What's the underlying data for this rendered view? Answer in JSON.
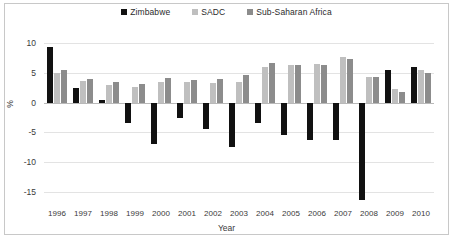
{
  "chart_data": {
    "type": "bar",
    "title": "",
    "subtitle": "",
    "xlabel": "Year",
    "ylabel": "%",
    "ylim": [
      -17.5,
      11
    ],
    "yticks": [
      10,
      5,
      0,
      -5,
      -10,
      -15
    ],
    "ytick_labels": [
      "10",
      "5",
      "0",
      "-5",
      "-10",
      "-15"
    ],
    "grid": true,
    "legend_position": "top-center",
    "categories": [
      "1996",
      "1997",
      "1998",
      "1999",
      "2000",
      "2001",
      "2002",
      "2003",
      "2004",
      "2005",
      "2006",
      "2007",
      "2008",
      "2009",
      "2010"
    ],
    "series": [
      {
        "name": "Zimbabwe",
        "color": "#111111",
        "values": [
          9.4,
          2.5,
          0.5,
          -3.5,
          -7.0,
          -2.5,
          -4.5,
          -7.5,
          -3.5,
          -5.5,
          -6.3,
          -6.2,
          -16.3,
          5.4,
          6.0
        ]
      },
      {
        "name": "SADC",
        "color": "#bfbfbf",
        "values": [
          4.9,
          3.6,
          2.9,
          2.7,
          3.4,
          3.5,
          3.3,
          3.5,
          6.0,
          6.3,
          6.5,
          7.6,
          4.3,
          2.2,
          5.5
        ]
      },
      {
        "name": "Sub-Saharan Africa",
        "color": "#8c8c8c",
        "values": [
          5.5,
          4.0,
          3.5,
          3.2,
          4.1,
          3.8,
          3.9,
          4.7,
          6.7,
          6.3,
          6.3,
          7.3,
          4.3,
          1.7,
          5.0
        ]
      }
    ]
  },
  "legend": {
    "entries": [
      {
        "label": "Zimbabwe",
        "color": "#111111"
      },
      {
        "label": "SADC",
        "color": "#bfbfbf"
      },
      {
        "label": "Sub-Saharan Africa",
        "color": "#8c8c8c"
      }
    ]
  },
  "axes": {
    "y_title": "%",
    "x_title": "Year"
  },
  "colors": {
    "zimbabwe": "#111111",
    "sadc": "#bfbfbf",
    "sub_saharan_africa": "#8c8c8c",
    "grid": "#e3e3e3",
    "zero_line": "#b9b9b9",
    "frame": "#c8c8c8",
    "background": "#ffffff"
  }
}
